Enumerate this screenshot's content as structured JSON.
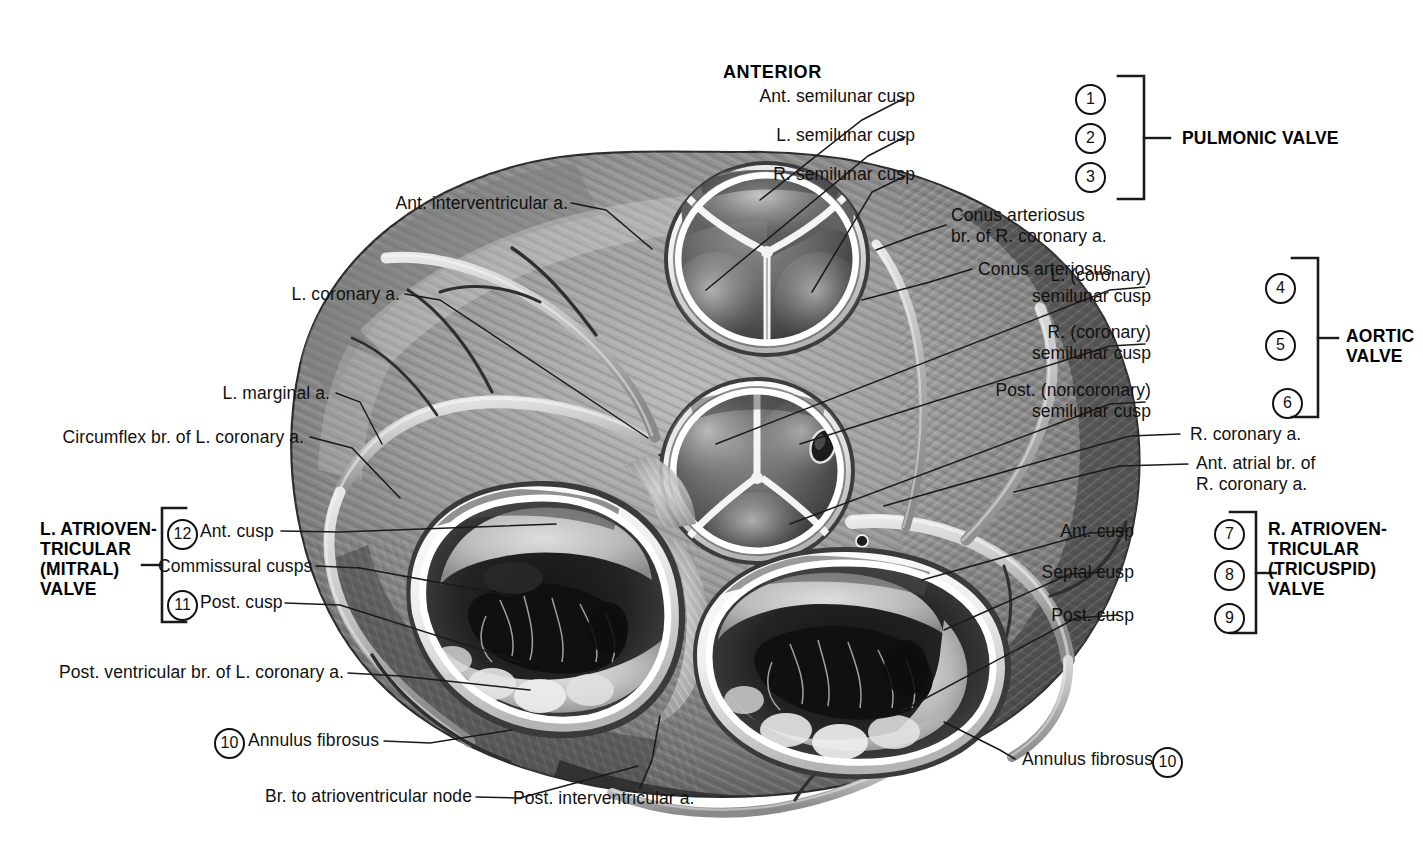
{
  "title": {
    "anterior": "ANTERIOR"
  },
  "groups": {
    "pulmonic": "PULMONIC VALVE",
    "aortic": "AORTIC\nVALVE",
    "left_av": "L. ATRIOVEN-\nTRICULAR\n(MITRAL)\nVALVE",
    "right_av": "R. ATRIOVEN-\nTRICULAR\n(TRICUSPID)\nVALVE"
  },
  "labels": [
    {
      "id": "ant-semilunar-cusp",
      "text": "Ant. semilunar cusp",
      "num": "1"
    },
    {
      "id": "l-semilunar-cusp",
      "text": "L. semilunar cusp",
      "num": "2"
    },
    {
      "id": "r-semilunar-cusp",
      "text": "R. semilunar cusp",
      "num": "3"
    },
    {
      "id": "conus-br-rca",
      "text": "Conus arteriosus\nbr. of R. coronary a.",
      "num": ""
    },
    {
      "id": "conus-arteriosus",
      "text": "Conus arteriosus",
      "num": ""
    },
    {
      "id": "l-coronary-cusp",
      "text": "L. (coronary)\nsemilunar cusp",
      "num": "4"
    },
    {
      "id": "r-coronary-cusp",
      "text": "R. (coronary)\nsemilunar cusp",
      "num": "5"
    },
    {
      "id": "post-noncoronary-cusp",
      "text": "Post. (noncoronary)\nsemilunar cusp",
      "num": "6"
    },
    {
      "id": "r-coronary-a",
      "text": "R. coronary a.",
      "num": ""
    },
    {
      "id": "ant-atrial-br",
      "text": "Ant. atrial br. of\nR. coronary a.",
      "num": ""
    },
    {
      "id": "tri-ant-cusp",
      "text": "Ant. cusp",
      "num": "7"
    },
    {
      "id": "tri-septal-cusp",
      "text": "Septal cusp",
      "num": "8"
    },
    {
      "id": "tri-post-cusp",
      "text": "Post. cusp",
      "num": "9"
    },
    {
      "id": "annulus-fibrosus-r",
      "text": "Annulus fibrosus",
      "num": "10"
    },
    {
      "id": "ant-interventricular-a",
      "text": "Ant. interventricular a.",
      "num": ""
    },
    {
      "id": "l-coronary-a",
      "text": "L. coronary a.",
      "num": ""
    },
    {
      "id": "l-marginal-a",
      "text": "L. marginal a.",
      "num": ""
    },
    {
      "id": "circumflex-br",
      "text": "Circumflex br. of L. coronary a.",
      "num": ""
    },
    {
      "id": "mit-ant-cusp",
      "text": "Ant. cusp",
      "num": "12"
    },
    {
      "id": "commissural-cusps",
      "text": "Commissural cusps",
      "num": ""
    },
    {
      "id": "mit-post-cusp",
      "text": "Post. cusp",
      "num": "11"
    },
    {
      "id": "post-ventricular-br",
      "text": "Post. ventricular br. of L. coronary a.",
      "num": ""
    },
    {
      "id": "annulus-fibrosus-l",
      "text": "Annulus fibrosus",
      "num": "10"
    },
    {
      "id": "br-to-av-node",
      "text": "Br. to atrioventricular node",
      "num": ""
    },
    {
      "id": "post-interventricular-a",
      "text": "Post. interventricular a.",
      "num": ""
    }
  ],
  "colors": {
    "ink": "#111111",
    "paper": "#ffffff",
    "leader": "#1a1a1a"
  }
}
